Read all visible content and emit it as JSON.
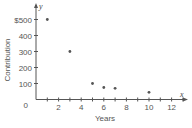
{
  "chart_data": {
    "type": "scatter",
    "title": "",
    "xlabel": "Years",
    "ylabel": "Contribution",
    "x_axis_var": "x",
    "y_axis_var": "y",
    "x": [
      1,
      3,
      5,
      6,
      7,
      10
    ],
    "y": [
      500,
      300,
      100,
      75,
      70,
      45
    ],
    "xlim": [
      0,
      13
    ],
    "ylim": [
      0,
      550
    ],
    "x_ticks": [
      2,
      4,
      6,
      8,
      10,
      12
    ],
    "x_minor_ticks": [
      1,
      2,
      3,
      4,
      5,
      6,
      7,
      8,
      9,
      10,
      11,
      12,
      13
    ],
    "y_ticks": [
      100,
      200,
      300,
      400,
      500
    ],
    "y_tick_labels": [
      "100",
      "200",
      "300",
      "400",
      "$500"
    ],
    "origin_label": "0",
    "grid": false,
    "legend": null,
    "point_color": "#555555",
    "axis_color": "#555555"
  }
}
